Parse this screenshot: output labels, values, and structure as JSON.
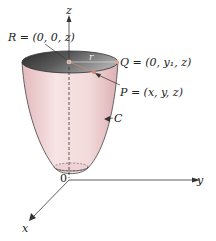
{
  "diagram": {
    "axes": {
      "z_label": "z",
      "y_label": "y",
      "x_label": "x",
      "origin_label": "0"
    },
    "points": {
      "R": "R = (0, 0, z)",
      "Q": "Q = (0, y₁, z)",
      "P": "P = (x, y, z)"
    },
    "radius_label": "r",
    "curve_label": "C",
    "colors": {
      "surface": "#f4dcdc",
      "surface_shade": "#e8c2c4",
      "interior_dark": "#3a3a3a",
      "interior_light": "#8a8a8a",
      "axis": "#333333",
      "point_marker": "#c98a7a"
    }
  }
}
